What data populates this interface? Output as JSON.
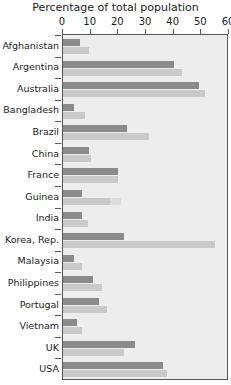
{
  "chart_data": {
    "type": "bar",
    "orientation": "horizontal",
    "title": "Percentage of total population",
    "xlabel": "",
    "ylabel": "",
    "xlim": [
      0,
      60
    ],
    "xticks": [
      0,
      10,
      20,
      30,
      40,
      50,
      60
    ],
    "xtick_labels": [
      "0",
      "10",
      "20",
      "30",
      "40",
      "50",
      "60"
    ],
    "grid": false,
    "legend": "none",
    "categories": [
      "Afghanistan",
      "Argentina",
      "Australia",
      "Bangladesh",
      "Brazil",
      "China",
      "France",
      "Guinea",
      "India",
      "Korea, Rep.",
      "Malaysia",
      "Philippines",
      "Portugal",
      "Vietnam",
      "UK",
      "USA"
    ],
    "series": [
      {
        "name": "dark",
        "color": "#8b8b8b",
        "values": [
          6,
          40,
          49,
          4,
          23,
          9.5,
          20,
          7,
          7,
          22,
          4,
          11,
          13,
          5,
          26,
          36
        ]
      },
      {
        "name": "light",
        "color": "#c9c9c9",
        "values": [
          9.5,
          43,
          51.5,
          8,
          31,
          10,
          20,
          17,
          9,
          55,
          7,
          14,
          16,
          7,
          22,
          37.5
        ]
      }
    ],
    "extra_segments": [
      {
        "category": "Guinea",
        "series": "light",
        "extends_to": 21,
        "color": "#dcdcdc"
      }
    ],
    "colors": {
      "dark_bar": "#8b8b8b",
      "light_bar": "#c9c9c9",
      "light_bar_faint": "#dcdcdc",
      "panel_background": "#ededed",
      "axis": "#55565a",
      "text": "#1a1a1a"
    }
  }
}
